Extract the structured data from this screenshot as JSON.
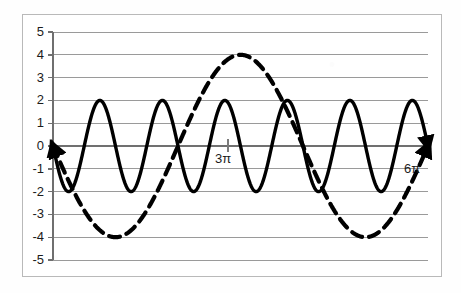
{
  "figure": {
    "background_color": "#ffffff",
    "frame_color": "#b9b9b9",
    "gridline_color": "#9a9a9a",
    "axis_color": "#6f6f6f",
    "curve_color": "#000000"
  },
  "chart_data": {
    "type": "line",
    "title": "",
    "subtitle": "",
    "xlabel": "",
    "ylabel": "",
    "grid": true,
    "legend_position": "none",
    "xlim": [
      0,
      18.8495559215
    ],
    "ylim": [
      -5,
      5
    ],
    "x_unit": "pi",
    "x_ticks": [
      9.42477796,
      18.84955592
    ],
    "x_tick_labels": [
      "3π",
      "6π"
    ],
    "y_ticks": [
      5,
      4,
      3,
      2,
      1,
      0,
      -1,
      -2,
      -3,
      -4,
      -5
    ],
    "y_tick_labels": [
      "5",
      "4",
      "3",
      "2",
      "1",
      "0",
      "-1",
      "-2",
      "-3",
      "-4",
      "-5"
    ],
    "series": [
      {
        "name": "solid-wave",
        "style": "solid",
        "color": "#000000",
        "line_width": 3.4,
        "amplitude": 2,
        "period_in_pi": 1,
        "cycles": 6,
        "equation": "y = -2 sin(2x)",
        "phase_deg": 180,
        "y_at_x0": 0,
        "max": 2,
        "min": -2,
        "arrow_start": true,
        "arrow_end": true,
        "peaks_y": 2,
        "troughs_y": -2
      },
      {
        "name": "dashed-wave",
        "style": "dashed",
        "color": "#000000",
        "line_width": 4.2,
        "dash_pattern": "11,7",
        "amplitude": 4,
        "period_in_pi": 4,
        "cycles": 1.5,
        "equation": "y = -4 sin(x/2)",
        "phase_deg": 180,
        "y_at_x0": 0,
        "max": 4,
        "min": -4,
        "arrow_start": true,
        "arrow_end": true,
        "peaks_y": 4,
        "troughs_y": -4,
        "peak_positions_in_pi": [
          1,
          5
        ],
        "trough_positions_in_pi": [
          3
        ]
      }
    ],
    "annotations": [
      {
        "name": "x-tick-3pi",
        "text": "3π",
        "x_in_pi": 3,
        "y": 0
      },
      {
        "name": "x-tick-6pi",
        "text": "6π",
        "x_in_pi": 6,
        "y": -0.6
      }
    ]
  }
}
